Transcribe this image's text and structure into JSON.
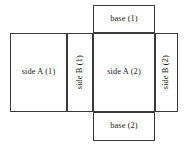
{
  "diagram": {
    "background_color": "#ffffff",
    "stroke_color": "#3a3a3a",
    "text_color": "#1a1a1a",
    "faces": [
      {
        "id": "base-1",
        "label": "base (1)",
        "orientation": "horizontal",
        "position": "top"
      },
      {
        "id": "side-a-1",
        "label": "side A (1)",
        "orientation": "horizontal",
        "position": "middle-left"
      },
      {
        "id": "side-b-1",
        "label": "side B (1)",
        "orientation": "vertical",
        "position": "middle-center-left"
      },
      {
        "id": "side-a-2",
        "label": "side A (2)",
        "orientation": "horizontal",
        "position": "middle-center-right"
      },
      {
        "id": "side-b-2",
        "label": "side B (2)",
        "orientation": "vertical",
        "position": "middle-right"
      },
      {
        "id": "base-2",
        "label": "base (2)",
        "orientation": "horizontal",
        "position": "bottom"
      }
    ]
  }
}
